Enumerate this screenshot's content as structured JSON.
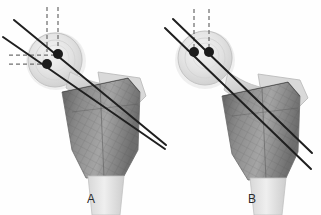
{
  "figure": {
    "background_color": "#fefefe",
    "width": 321,
    "height": 215
  },
  "panels": [
    {
      "id": "panel-a",
      "label": "A",
      "label_x": 87,
      "label_y": 192,
      "description": "Proximal femur with two divergent guide wires; entry points vertically and horizontally offset",
      "anatomy": {
        "name": "proximal-femur",
        "femoral_head_center_x": 55,
        "femoral_head_center_y": 60,
        "femoral_head_radius": 28,
        "shaft_fill": "#8d8d8d",
        "soft_tissue_fill": "#dedede",
        "cortex_stroke": "#9a9a9a"
      },
      "markers": [
        {
          "name": "marker-superior",
          "x": 58,
          "y": 54,
          "r": 5,
          "color": "#1c1c1c"
        },
        {
          "name": "marker-inferior",
          "x": 47,
          "y": 64,
          "r": 5,
          "color": "#1c1c1c"
        }
      ],
      "guide_wires": [
        {
          "name": "guide-wire-upper",
          "x1": 14,
          "y1": 20,
          "x2": 166,
          "y2": 145,
          "color": "#1f1f1f",
          "width": 2.0
        },
        {
          "name": "guide-wire-lower",
          "x1": 3,
          "y1": 37,
          "x2": 165,
          "y2": 149,
          "color": "#1f1f1f",
          "width": 2.0
        }
      ],
      "reference_lines": [
        {
          "name": "vertical-reference-right",
          "orientation": "vertical",
          "x1": 58,
          "y1": 7,
          "x2": 58,
          "y2": 54,
          "color": "#6f6f6f"
        },
        {
          "name": "vertical-reference-left",
          "orientation": "vertical",
          "x1": 47,
          "y1": 7,
          "x2": 47,
          "y2": 52,
          "color": "#6f6f6f"
        },
        {
          "name": "horizontal-reference-upper",
          "orientation": "horizontal",
          "x1": 9,
          "y1": 55,
          "x2": 58,
          "y2": 55,
          "color": "#6f6f6f"
        },
        {
          "name": "horizontal-reference-lower",
          "orientation": "horizontal",
          "x1": 9,
          "y1": 64,
          "x2": 47,
          "y2": 64,
          "color": "#6f6f6f"
        }
      ]
    },
    {
      "id": "panel-b",
      "label": "B",
      "label_x": 248,
      "label_y": 192,
      "description": "Proximal femur with two parallel guide wires; entry points at equal height",
      "anatomy": {
        "name": "proximal-femur",
        "femoral_head_center_x": 205,
        "femoral_head_center_y": 58,
        "femoral_head_radius": 28,
        "shaft_fill": "#8d8d8d",
        "soft_tissue_fill": "#dedede",
        "cortex_stroke": "#9a9a9a"
      },
      "markers": [
        {
          "name": "marker-lateral",
          "x": 194,
          "y": 52,
          "r": 5,
          "color": "#1c1c1c"
        },
        {
          "name": "marker-medial",
          "x": 209,
          "y": 52,
          "r": 5,
          "color": "#1c1c1c"
        }
      ],
      "guide_wires": [
        {
          "name": "guide-wire-upper",
          "x1": 173,
          "y1": 19,
          "x2": 312,
          "y2": 153,
          "color": "#1f1f1f",
          "width": 2.0
        },
        {
          "name": "guide-wire-lower",
          "x1": 165,
          "y1": 28,
          "x2": 311,
          "y2": 169,
          "color": "#1f1f1f",
          "width": 2.0
        }
      ],
      "reference_lines": [
        {
          "name": "vertical-reference-medial",
          "orientation": "vertical",
          "x1": 209,
          "y1": 9,
          "x2": 209,
          "y2": 52,
          "color": "#6f6f6f"
        },
        {
          "name": "vertical-reference-lateral",
          "orientation": "vertical",
          "x1": 194,
          "y1": 9,
          "x2": 194,
          "y2": 48,
          "color": "#6f6f6f"
        }
      ]
    }
  ]
}
